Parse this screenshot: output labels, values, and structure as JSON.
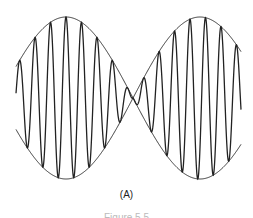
{
  "figure": {
    "panel_label": "(A)",
    "caption_partial": "Figure 5.5",
    "colors": {
      "line": "#222222",
      "background": "#ffffff"
    },
    "wave": {
      "x_start": 16,
      "x_end": 241,
      "center_y": 98,
      "envelope_amplitude": 81,
      "envelope_period_px": 134,
      "envelope_peak_x": [
        66,
        188
      ],
      "node_x": 133,
      "carrier_period_px": 15.5
    }
  }
}
